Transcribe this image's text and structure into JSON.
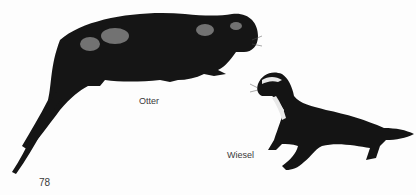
{
  "page": {
    "page_number": "78",
    "illustrations": [
      {
        "name": "otter",
        "caption": "Otter",
        "icon": "otter-illustration"
      },
      {
        "name": "weasel",
        "caption": "Wiesel",
        "icon": "weasel-illustration"
      }
    ]
  },
  "colors": {
    "ink": "#111111",
    "paper": "#fdfdfd",
    "caption_text": "#3a3a3a"
  }
}
